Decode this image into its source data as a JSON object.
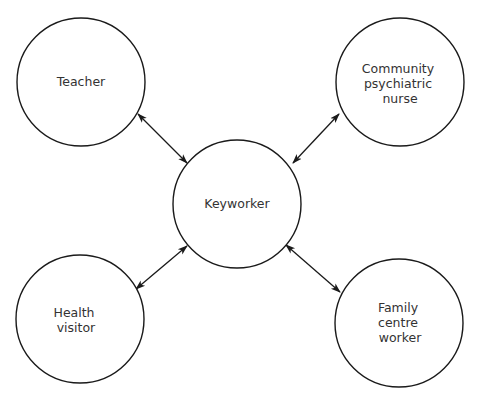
{
  "diagram": {
    "type": "hub-and-spoke",
    "colors": {
      "stroke": "#1a1a1a",
      "text": "#333333",
      "background": "#ffffff"
    },
    "hub": {
      "id": "keyworker",
      "lines": [
        "Keyworker"
      ]
    },
    "nodes": [
      {
        "id": "teacher",
        "lines": [
          "Teacher"
        ]
      },
      {
        "id": "community-psychiatric-nurse",
        "lines": [
          "Community",
          "psychiatric",
          "nurse"
        ]
      },
      {
        "id": "health-visitor",
        "lines": [
          "Health",
          "visitor"
        ]
      },
      {
        "id": "family-centre-worker",
        "lines": [
          "Family",
          "centre",
          "worker"
        ]
      }
    ],
    "edges": [
      {
        "from": "teacher",
        "to": "keyworker",
        "direction": "bidirectional"
      },
      {
        "from": "community-psychiatric-nurse",
        "to": "keyworker",
        "direction": "bidirectional"
      },
      {
        "from": "health-visitor",
        "to": "keyworker",
        "direction": "bidirectional"
      },
      {
        "from": "family-centre-worker",
        "to": "keyworker",
        "direction": "bidirectional"
      }
    ]
  }
}
